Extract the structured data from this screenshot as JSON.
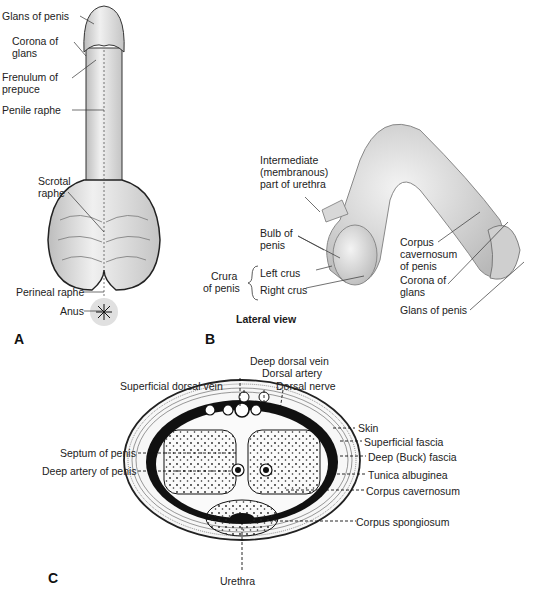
{
  "panels": {
    "A": {
      "letter": "A",
      "labels": {
        "glans": "Glans of penis",
        "corona_1": "Corona of",
        "corona_2": "glans",
        "frenulum_1": "Frenulum of",
        "frenulum_2": "prepuce",
        "penile_raphe": "Penile raphe",
        "scrotal_1": "Scrotal",
        "scrotal_2": "raphe",
        "perineal_raphe": "Perineal raphe",
        "anus": "Anus"
      }
    },
    "B": {
      "letter": "B",
      "caption": "Lateral view",
      "labels": {
        "intermediate_1": "Intermediate",
        "intermediate_2": "(membranous)",
        "intermediate_3": "part of urethra",
        "bulb_1": "Bulb of",
        "bulb_2": "penis",
        "crura_1": "Crura",
        "crura_2": "of penis",
        "left_crus": "Left crus",
        "right_crus": "Right crus",
        "corpus_cav_1": "Corpus",
        "corpus_cav_2": "cavernosum",
        "corpus_cav_3": "of penis",
        "corona_1": "Corona of",
        "corona_2": "glans",
        "glans": "Glans of penis"
      }
    },
    "C": {
      "letter": "C",
      "labels": {
        "deep_dorsal_vein": "Deep dorsal vein",
        "dorsal_artery": "Dorsal artery",
        "superficial_dorsal_vein": "Superficial dorsal vein",
        "dorsal_nerve": "Dorsal nerve",
        "skin": "Skin",
        "superficial_fascia": "Superficial fascia",
        "deep_fascia": "Deep (Buck) fascia",
        "tunica": "Tunica albuginea",
        "corpus_cavernosum": "Corpus cavernosum",
        "corpus_spongiosum": "Corpus spongiosum",
        "septum": "Septum of penis",
        "deep_artery": "Deep artery of penis",
        "urethra": "Urethra"
      }
    }
  },
  "colors": {
    "ink": "#111111",
    "tissue": "#e6e6e6",
    "shade": "#9a9a9a",
    "skin_fill": "#f2f2f2"
  }
}
